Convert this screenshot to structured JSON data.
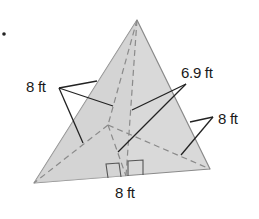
{
  "figure": {
    "type": "triangular pyramid (regular tetrahedron-like)",
    "bullet": "•",
    "colors": {
      "face": "#d9d9d9",
      "edge": "#8a8a8a",
      "leader": "#222222",
      "text": "#1a1a1a"
    },
    "labels": {
      "lateral_edge_left": "8 ft",
      "slant_height": "6.9 ft",
      "lateral_edge_right": "8 ft",
      "base_edge": "8 ft"
    },
    "marks": {
      "right_angles": 2
    }
  }
}
